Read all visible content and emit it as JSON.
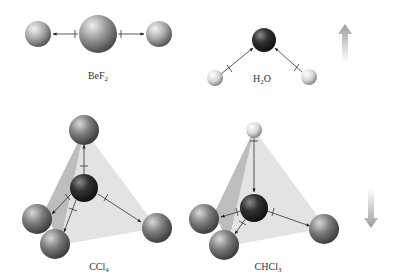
{
  "molecules": [
    {
      "id": "bef2",
      "formula": "BeF",
      "subscript": "2",
      "label_x": 98,
      "label_y": 70
    },
    {
      "id": "h2o",
      "formula_pre": "H",
      "subscript": "2",
      "formula_post": "O",
      "label_x": 262,
      "label_y": 73
    },
    {
      "id": "ccl4",
      "formula": "CCl",
      "subscript": "4",
      "label_x": 99,
      "label_y": 261
    },
    {
      "id": "chcl3",
      "formula": "CHCl",
      "subscript": "3",
      "label_x": 268,
      "label_y": 261
    }
  ],
  "trend_arrows": [
    {
      "id": "up",
      "direction": "up"
    },
    {
      "id": "down",
      "direction": "down"
    }
  ],
  "colors": {
    "halogen_atom": "#7a7a7a",
    "central_atom_dark": "#2b2b2b",
    "beryllium_atom": "#8c8c8c",
    "hydrogen_atom": "#e8e8e8",
    "tetrahedron_face": "#d8d8d8",
    "arrow_gradient": "#9a9a9a"
  }
}
